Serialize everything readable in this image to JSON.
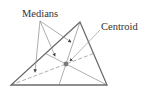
{
  "diagram": {
    "labels": {
      "medians": "Medians",
      "centroid": "Centroid"
    },
    "colors": {
      "triangle_stroke": "#6b6b6b",
      "median_stroke": "#9a9a9a",
      "pointer_stroke": "#8a8a8a",
      "centroid_fill": "#7a7a7a",
      "text": "#333333"
    },
    "vertices": {
      "A": [
        80,
        22
      ],
      "B": [
        11,
        85
      ],
      "C": [
        107,
        85
      ]
    },
    "centroid": [
      66,
      64
    ]
  }
}
